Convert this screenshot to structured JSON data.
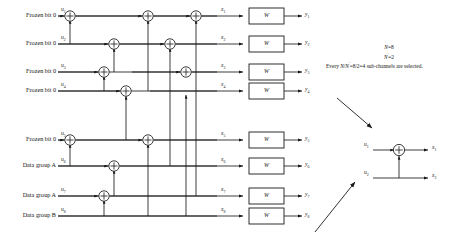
{
  "diagram": {
    "type": "polar-encoder-butterfly",
    "stages": 3,
    "channels": 8
  },
  "rows": [
    {
      "label": "Frozen bit 0",
      "u": "u",
      "u_sub": "1",
      "x": "x",
      "x_sub": "1",
      "w": "W",
      "y": "y",
      "y_sub": "1"
    },
    {
      "label": "Frozen bit 0",
      "u": "u",
      "u_sub": "2",
      "x": "x",
      "x_sub": "2",
      "w": "W",
      "y": "y",
      "y_sub": "2"
    },
    {
      "label": "Frozen bit 0",
      "u": "u",
      "u_sub": "3",
      "x": "x",
      "x_sub": "3",
      "w": "W",
      "y": "y",
      "y_sub": "3"
    },
    {
      "label": "Frozen bit 0",
      "u": "u",
      "u_sub": "4",
      "x": "x",
      "x_sub": "4",
      "w": "W",
      "y": "y",
      "y_sub": "4"
    },
    {
      "label": "Frozen bit 0",
      "u": "u",
      "u_sub": "5",
      "x": "x",
      "x_sub": "5",
      "w": "W",
      "y": "y",
      "y_sub": "5"
    },
    {
      "label": "Data group A",
      "u": "u",
      "u_sub": "6",
      "x": "x",
      "x_sub": "6",
      "w": "W",
      "y": "y",
      "y_sub": "6"
    },
    {
      "label": "Data group A",
      "u": "u",
      "u_sub": "7",
      "x": "x",
      "x_sub": "7",
      "w": "W",
      "y": "y",
      "y_sub": "7"
    },
    {
      "label": "Data group B",
      "u": "u",
      "u_sub": "8",
      "x": "x",
      "x_sub": "8",
      "w": "W",
      "y": "y",
      "y_sub": "8"
    }
  ],
  "annotation": {
    "line1_var": "N",
    "line1_val": "=8",
    "line2_var": "N",
    "line2_sup": "'",
    "line2_val": "=2",
    "line3_prefix": "Every ",
    "line3_var1": "N",
    "line3_slash": "/",
    "line3_var2": "N",
    "line3_sup": "'",
    "line3_val": "=8/2=4 sub-channels are selected."
  },
  "subunit": {
    "in_top": "u",
    "in_top_sub": "1",
    "in_bot": "u",
    "in_bot_sub": "2",
    "out_top": "x",
    "out_top_sub": "1",
    "out_bot": "x",
    "out_bot_sub": "2"
  },
  "colors": {
    "line": "#1a1a1a",
    "background": "#ffffff",
    "box_fill": "#ffffff"
  }
}
